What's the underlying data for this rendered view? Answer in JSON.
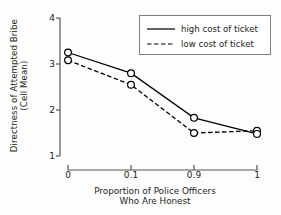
{
  "chart_data": {
    "type": "line",
    "title": "",
    "subtitle": "",
    "xlabel_line1": "Proportion of Police Officers",
    "xlabel_line2": "Who Are Honest",
    "ylabel_line1": "Directness of Attempted Bribe",
    "ylabel_line2": "(Cell Mean)",
    "categories": [
      "0",
      "0.1",
      "0.9",
      "1"
    ],
    "x_tick_labels": [
      "0",
      "0.1",
      "0.9",
      "1"
    ],
    "y_tick_labels": [
      "1",
      "2",
      "3",
      "4"
    ],
    "y_tick_values": [
      1,
      2,
      3,
      4
    ],
    "ylim": [
      1,
      4
    ],
    "grid": false,
    "legend_position": "top-right",
    "marker": "open-circle",
    "series": [
      {
        "name": "high cost of ticket",
        "style": "solid",
        "color": "#000000",
        "values": [
          3.25,
          2.8,
          1.83,
          1.48
        ]
      },
      {
        "name": "low cost of ticket",
        "style": "dashed",
        "color": "#000000",
        "values": [
          3.08,
          2.55,
          1.5,
          1.55
        ]
      }
    ]
  },
  "legend": {
    "items": [
      {
        "label": "high cost of ticket",
        "style": "solid"
      },
      {
        "label": "low cost of ticket",
        "style": "dashed"
      }
    ]
  },
  "colors": {
    "background": "#fdfdfd",
    "ink": "#231f20",
    "axis": "#555555",
    "legend_border": "#7d7d7d",
    "marker_fill": "#ffffff"
  }
}
